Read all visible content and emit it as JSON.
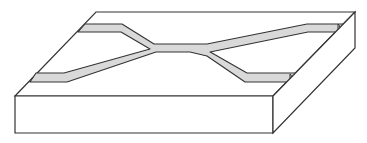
{
  "figure": {
    "title": "",
    "colors": {
      "background": "#ffffff",
      "outline": "#333333",
      "slab_fill": "#ffffff",
      "waveguide_fill": "#d9d9d9"
    },
    "slab": {
      "top_face": [
        [
          96,
          12
        ],
        [
          355,
          12
        ],
        [
          273,
          96
        ],
        [
          15,
          96
        ]
      ],
      "front_face": [
        [
          15,
          96
        ],
        [
          273,
          96
        ],
        [
          273,
          133
        ],
        [
          15,
          133
        ]
      ],
      "right_face": [
        [
          273,
          96
        ],
        [
          355,
          12
        ],
        [
          355,
          48
        ],
        [
          273,
          133
        ]
      ]
    },
    "waveguide": {
      "shape": "M85,24 L122,24 L154,44 L160,44 L190,44 L207,44 L307,24 L343,24 L339,32 L308,32 L210,52 L212,53 L247,73 L296,73 L291,82 L245,82 L207,56 L190,52 L160,52 L156,52 L67,82 L30,82 L36,73 L64,73 L150,49 L121,32 L78,32 Z",
      "end_caps": [
        {
          "cx": 339,
          "cy": 28,
          "rx": 5,
          "ry": 5
        },
        {
          "cx": 291,
          "cy": 78,
          "rx": 5,
          "ry": 5
        }
      ]
    }
  }
}
